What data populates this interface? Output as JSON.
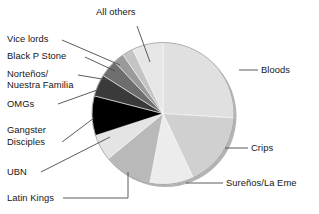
{
  "chart_data": {
    "type": "pie",
    "title": "",
    "subtitle": "",
    "xlabel": "",
    "ylabel": "",
    "legend_position": "callout-labels",
    "grid": false,
    "total": 100,
    "categories": [
      "Bloods",
      "Crips",
      "Sureños/La Eme",
      "Latin Kings",
      "UBN",
      "Gangster Disciples",
      "OMGs",
      "Norteños/\nNuestra Familia",
      "Black P Stone",
      "Vice lords",
      "All others"
    ],
    "values": [
      26,
      17,
      10,
      11,
      6,
      9,
      5,
      4,
      2.5,
      2.5,
      7
    ],
    "colors": [
      "#e0e0e0",
      "#d0d0d0",
      "#ececec",
      "#b9b9b9",
      "#e4e4e4",
      "#000000",
      "#3a3a3a",
      "#6e6e6e",
      "#9a9a9a",
      "#c4c4c4",
      "#e6e6e6"
    ],
    "start_angle_deg": 0,
    "direction": "clockwise",
    "rim_color": "#b3b3b3",
    "outline_color": "#8c8c8c"
  },
  "labels": {
    "all_others": "All others",
    "vice_lords": "Vice lords",
    "black_p_stone": "Black P Stone",
    "nortenos_line1": "Norteños/",
    "nortenos_line2": "Nuestra Familia",
    "omgs": "OMGs",
    "gangster_line1": "Gangster",
    "gangster_line2": "Disciples",
    "ubn": "UBN",
    "latin_kings": "Latin Kings",
    "bloods": "Bloods",
    "crips": "Crips",
    "surenos": "Sureños/La Eme"
  }
}
